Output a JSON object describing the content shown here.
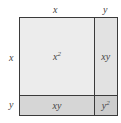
{
  "diagram": {
    "title": "",
    "top_labels": {
      "x": "x",
      "y": "y"
    },
    "side_labels": {
      "x": "x",
      "y": "y"
    },
    "regions": [
      {
        "id": "x2",
        "base": "x",
        "exp": "2",
        "color": "#ececec"
      },
      {
        "id": "xy_right",
        "text": "xy",
        "color": "#e2e2e2"
      },
      {
        "id": "xy_bottom",
        "text": "xy",
        "color": "#d6d6d6"
      },
      {
        "id": "y2",
        "base": "y",
        "exp": "2",
        "color": "#cdcdcd"
      }
    ],
    "border_color": "#3a3a3a"
  }
}
